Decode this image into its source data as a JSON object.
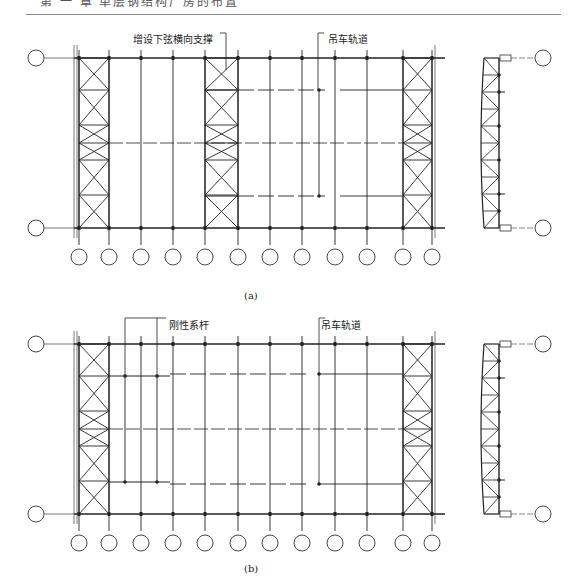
{
  "header": {
    "text": "第 一 章  单层钢结构厂房的布置"
  },
  "figures": [
    {
      "id": "a",
      "caption": "(a)",
      "labels": {
        "bracing": "增设下弦横向支撑",
        "rail": "吊车轨道"
      },
      "bottom_axis_count": 12,
      "side_axis_count": 2
    },
    {
      "id": "b",
      "caption": "(b)",
      "labels": {
        "tie": "刚性系杆",
        "rail": "吊车轨道"
      },
      "bottom_axis_count": 12,
      "side_axis_count": 2
    }
  ],
  "colors": {
    "line": "#222222",
    "light_line": "#555555"
  }
}
